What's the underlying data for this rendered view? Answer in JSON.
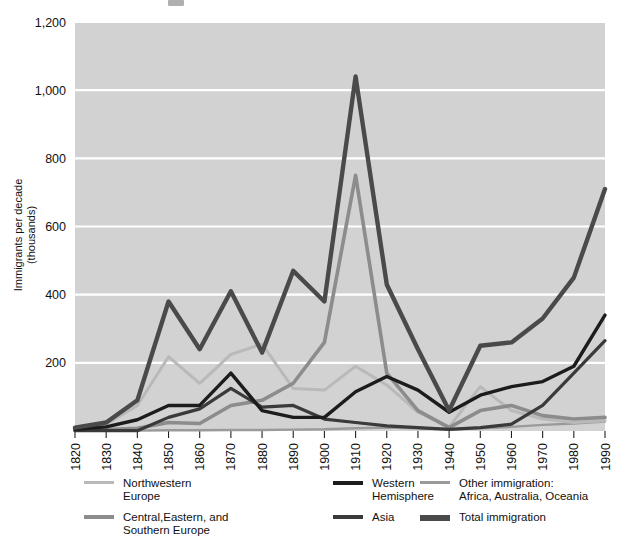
{
  "figure": {
    "background_color": "#ffffff",
    "plot_background_color": "#d2d2d2",
    "gridline_color": "#ffffff"
  },
  "axes": {
    "y_axis_title": "Immigrants per decade\n(thousands)",
    "y_ticks": [
      "1,200",
      "1,000",
      "800",
      "600",
      "400",
      "200"
    ],
    "x_ticks": [
      "1820",
      "1830",
      "1840",
      "1850",
      "1860",
      "1870",
      "1880",
      "1890",
      "1900",
      "1910",
      "1920",
      "1930",
      "1940",
      "1950",
      "1960",
      "1970",
      "1980",
      "1990"
    ]
  },
  "legend": {
    "items": [
      {
        "label": "Northwestern\nEurope",
        "color": "#b9b9b9",
        "thickness": 3
      },
      {
        "label": "Central,Eastern, and\nSouthern Europe",
        "color": "#8c8c8c",
        "thickness": 4
      },
      {
        "label": "Western\nHemisphere",
        "color": "#1c1c1c",
        "thickness": 4
      },
      {
        "label": "Asia",
        "color": "#3a3a3a",
        "thickness": 4
      },
      {
        "label": "Other immigration:\nAfrica, Australia, Oceania",
        "color": "#9a9a9a",
        "thickness": 3
      },
      {
        "label": "Total immigration",
        "color": "#4a4a4a",
        "thickness": 6
      }
    ]
  },
  "chart_data": {
    "type": "line",
    "title": "",
    "xlabel": "",
    "ylabel": "Immigrants per decade (thousands)",
    "xlim": [
      1820,
      1990
    ],
    "ylim": [
      0,
      1200
    ],
    "grid": true,
    "legend_position": "below",
    "x": [
      1820,
      1830,
      1840,
      1850,
      1860,
      1870,
      1880,
      1890,
      1900,
      1910,
      1920,
      1930,
      1940,
      1950,
      1960,
      1970,
      1980,
      1990
    ],
    "series": [
      {
        "name": "Northwestern Europe",
        "color": "#b9b9b9",
        "values": [
          8,
          20,
          75,
          218,
          140,
          225,
          255,
          125,
          120,
          190,
          135,
          55,
          12,
          130,
          60,
          35,
          25,
          30
        ]
      },
      {
        "name": "Central,Eastern, and Southern Europe",
        "color": "#8c8c8c",
        "values": [
          2,
          4,
          8,
          25,
          22,
          75,
          90,
          140,
          260,
          750,
          170,
          60,
          10,
          60,
          75,
          45,
          35,
          40
        ]
      },
      {
        "name": "Western Hemisphere",
        "color": "#1c1c1c",
        "values": [
          5,
          12,
          33,
          75,
          75,
          170,
          60,
          40,
          40,
          115,
          160,
          120,
          55,
          105,
          130,
          145,
          190,
          340
        ]
      },
      {
        "name": "Asia",
        "color": "#3a3a3a",
        "values": [
          1,
          1,
          1,
          40,
          65,
          125,
          70,
          75,
          35,
          25,
          15,
          10,
          5,
          10,
          20,
          75,
          170,
          265
        ]
      },
      {
        "name": "Other immigration: Africa, Australia, Oceania",
        "color": "#9a9a9a",
        "values": [
          1,
          1,
          1,
          2,
          2,
          3,
          3,
          4,
          5,
          8,
          10,
          8,
          5,
          8,
          12,
          18,
          22,
          28
        ]
      },
      {
        "name": "Total immigration",
        "color": "#4a4a4a",
        "values": [
          10,
          25,
          90,
          380,
          240,
          410,
          230,
          470,
          380,
          1040,
          430,
          240,
          60,
          250,
          260,
          330,
          450,
          710
        ]
      }
    ]
  }
}
